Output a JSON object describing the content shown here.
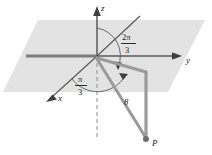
{
  "figure": {
    "name": "spherical-coordinates-diagram",
    "background": "#ffffff",
    "plane_fill": "#e2e2e2",
    "axis_color": "#6b6b6b",
    "ray_color": "#8c8c8c",
    "text_color": "#1a1a1a"
  },
  "axes": {
    "z_label": "z",
    "y_label": "y",
    "x_label": "x"
  },
  "angles": {
    "azimuth": {
      "numerator": "2π",
      "denominator": "3"
    },
    "polar": {
      "numerator": "π",
      "denominator": "3"
    }
  },
  "radius": {
    "label": "8"
  },
  "point": {
    "label": "P"
  }
}
